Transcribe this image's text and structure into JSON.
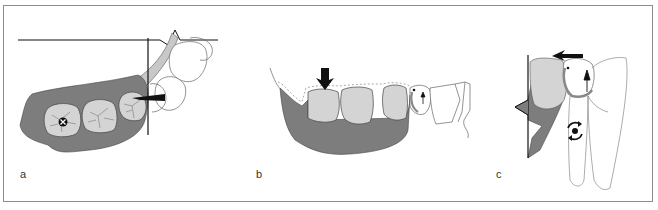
{
  "figure": {
    "panels": [
      {
        "id": "a",
        "label": "a",
        "description": "Occlusal view of mandibular molars in grey bone with arrow pointing mesially toward reference line; X-circle marker on first molar"
      },
      {
        "id": "b",
        "label": "b",
        "description": "Lateral view of mandibular posterior teeth with dotted outline, downward arrow on molar, small upward arrow on premolar"
      },
      {
        "id": "c",
        "label": "c",
        "description": "Cross-section view with horizontal arrow at crown, upward arrow, and rotation symbol on root"
      }
    ],
    "colors": {
      "bone": "#7d7d7d",
      "tooth": "#d4d4d4",
      "outline": "#555555",
      "line": "#111111",
      "border": "#8c8c8c"
    }
  }
}
